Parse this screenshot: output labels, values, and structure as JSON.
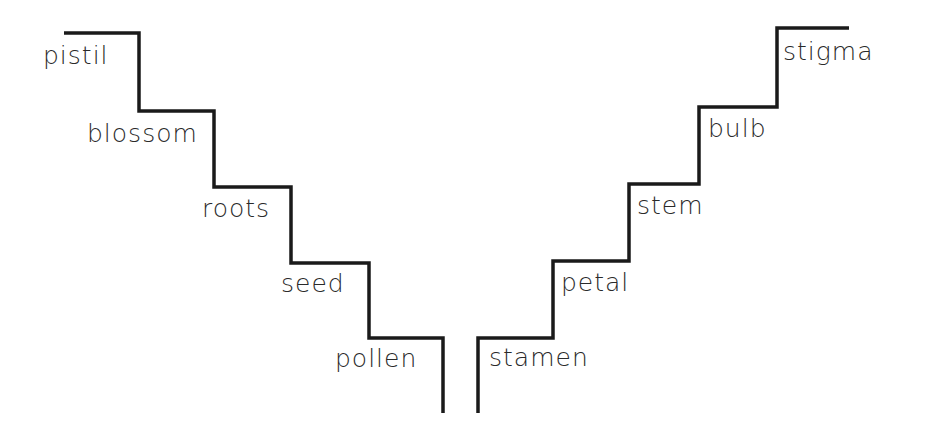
{
  "diagram": {
    "line_color": "#1a1a1a",
    "text_color": "#2a2a2a",
    "left_staircase": {
      "direction": "descending",
      "steps": [
        {
          "label": "pistil"
        },
        {
          "label": "blossom"
        },
        {
          "label": "roots"
        },
        {
          "label": "seed"
        },
        {
          "label": "pollen"
        }
      ]
    },
    "right_staircase": {
      "direction": "ascending",
      "steps": [
        {
          "label": "stamen"
        },
        {
          "label": "petal"
        },
        {
          "label": "stem"
        },
        {
          "label": "bulb"
        },
        {
          "label": "stigma"
        }
      ]
    }
  }
}
